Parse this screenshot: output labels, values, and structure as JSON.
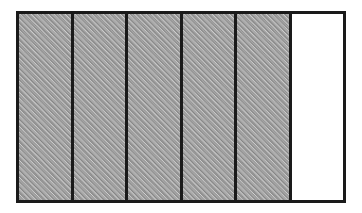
{
  "figure": {
    "name": "area-model-fraction-diagram",
    "type": "rectangular area model",
    "shape": "rectangle",
    "orientation": "horizontal",
    "division_direction": "vertical",
    "total_parts": 6,
    "shaded_parts": 5,
    "unshaded_parts": 1,
    "fraction_shaded": "5/6",
    "fill_style": "diagonal hatch",
    "hatch_direction": "forward-slash",
    "hatch_angle_degrees": 45,
    "colors": {
      "outline": "#1a1a1a",
      "divider": "#1a1a1a",
      "shaded_fill": "#a9a9a9",
      "unshaded_fill": "#ffffff",
      "background": "#ffffff"
    },
    "parts": [
      {
        "index": 1,
        "state": "shaded",
        "fill": "hatched-gray"
      },
      {
        "index": 2,
        "state": "shaded",
        "fill": "hatched-gray"
      },
      {
        "index": 3,
        "state": "shaded",
        "fill": "hatched-gray"
      },
      {
        "index": 4,
        "state": "shaded",
        "fill": "hatched-gray"
      },
      {
        "index": 5,
        "state": "shaded",
        "fill": "hatched-gray"
      },
      {
        "index": 6,
        "state": "unshaded",
        "fill": "white"
      }
    ]
  }
}
